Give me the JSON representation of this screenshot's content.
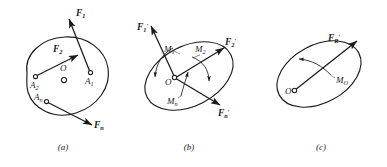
{
  "figure": {
    "background_color": "#ffffff",
    "stroke_color": "#1a1a1a"
  },
  "panels": [
    {
      "id": "a",
      "caption": "(a)",
      "center_label": "O",
      "points": [
        {
          "name": "A1",
          "base": "A",
          "sub": "1"
        },
        {
          "name": "A2",
          "base": "A",
          "sub": "2"
        },
        {
          "name": "An",
          "base": "A",
          "sub": "n"
        }
      ],
      "forces": [
        {
          "name": "F1",
          "base": "F",
          "sub": "1",
          "prime": ""
        },
        {
          "name": "F2",
          "base": "F",
          "sub": "2",
          "prime": ""
        },
        {
          "name": "Fn",
          "base": "F",
          "sub": "n",
          "prime": ""
        }
      ],
      "moments": []
    },
    {
      "id": "b",
      "caption": "(b)",
      "center_label": "O",
      "points": [],
      "forces": [
        {
          "name": "F1p",
          "base": "F",
          "sub": "1",
          "prime": "′"
        },
        {
          "name": "F2p",
          "base": "F",
          "sub": "2",
          "prime": "′"
        },
        {
          "name": "Fnp",
          "base": "F",
          "sub": "n",
          "prime": "′"
        }
      ],
      "moments": [
        {
          "name": "M1",
          "base": "M",
          "sub": "1"
        },
        {
          "name": "M2",
          "base": "M",
          "sub": "2"
        },
        {
          "name": "Mn",
          "base": "M",
          "sub": "n"
        }
      ]
    },
    {
      "id": "c",
      "caption": "(c)",
      "center_label": "O",
      "points": [],
      "forces": [
        {
          "name": "FRp",
          "base": "F",
          "sub": "R",
          "prime": "′"
        }
      ],
      "moments": [
        {
          "name": "MO",
          "base": "M",
          "sub": "O"
        }
      ]
    }
  ],
  "labels": {
    "a": {
      "F1_base": "F",
      "F1_sub": "1",
      "F2_base": "F",
      "F2_sub": "2",
      "Fn_base": "F",
      "Fn_sub": "n",
      "A1_base": "A",
      "A1_sub": "1",
      "A2_base": "A",
      "A2_sub": "2",
      "An_base": "A",
      "An_sub": "n",
      "O": "O",
      "caption": "(a)"
    },
    "b": {
      "F1_base": "F",
      "F1_sub": "1",
      "F1_prime": "′",
      "F2_base": "F",
      "F2_sub": "2",
      "F2_prime": "′",
      "Fn_base": "F",
      "Fn_sub": "n",
      "Fn_prime": "′",
      "M1_base": "M",
      "M1_sub": "1",
      "M2_base": "M",
      "M2_sub": "2",
      "Mn_base": "M",
      "Mn_sub": "n",
      "O": "O",
      "caption": "(b)"
    },
    "c": {
      "FR_base": "F",
      "FR_sub": "R",
      "FR_prime": "′",
      "MO_base": "M",
      "MO_sub": "O",
      "O": "O",
      "caption": "(c)"
    }
  }
}
